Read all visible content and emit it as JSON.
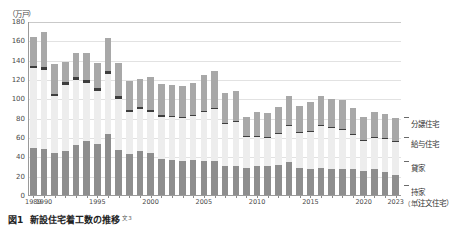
{
  "caption": {
    "number": "図1",
    "title": "新設住宅着工数の推移",
    "reference": "文3"
  },
  "chart_data": {
    "type": "bar",
    "stacked": true,
    "title": "新設住宅着工数の推移",
    "xlabel": "年",
    "ylabel": "万戸",
    "y_unit_label": "（万戸）",
    "x_unit_label": "（年）",
    "ylim": [
      0,
      180
    ],
    "ytick_step": 20,
    "yticks": [
      0,
      20,
      40,
      60,
      80,
      100,
      120,
      140,
      160,
      180
    ],
    "grid": true,
    "legend_position": "right",
    "categories": [
      "1989",
      "1990",
      "1991",
      "1992",
      "1993",
      "1994",
      "1995",
      "1996",
      "1997",
      "1998",
      "1999",
      "2000",
      "2001",
      "2002",
      "2003",
      "2004",
      "2005",
      "2006",
      "2007",
      "2008",
      "2009",
      "2010",
      "2011",
      "2012",
      "2013",
      "2014",
      "2015",
      "2016",
      "2017",
      "2018",
      "2019",
      "2020",
      "2021",
      "2022",
      "2023"
    ],
    "xtick_labels": [
      "1989",
      "1990",
      "1995",
      "2000",
      "2005",
      "2010",
      "2015",
      "2020",
      "2023"
    ],
    "series": [
      {
        "name": "持家（注文住宅）",
        "key": "owner",
        "color": "#8e8e8e",
        "values": [
          50,
          49,
          44,
          47,
          53,
          57,
          54,
          64,
          48,
          43,
          47,
          45,
          38,
          37,
          36,
          37,
          36,
          36,
          31,
          31,
          29,
          31,
          31,
          32,
          35,
          29,
          28,
          29,
          28,
          28,
          28,
          26,
          28,
          25,
          22
        ]
      },
      {
        "name": "貸家",
        "key": "rental",
        "color": "#ededed",
        "values": [
          82,
          81,
          59,
          68,
          67,
          60,
          55,
          62,
          52,
          44,
          43,
          42,
          44,
          45,
          45,
          46,
          51,
          54,
          44,
          46,
          32,
          30,
          29,
          32,
          37,
          36,
          38,
          43,
          42,
          40,
          35,
          31,
          32,
          34,
          34
        ]
      },
      {
        "name": "給与住宅",
        "key": "company",
        "color": "#3d3d3d",
        "values": [
          3,
          3,
          3,
          3,
          3,
          3,
          3,
          3,
          3,
          2,
          2,
          2,
          2,
          1,
          1,
          1,
          1,
          1,
          1,
          1,
          1,
          1,
          1,
          1,
          1,
          1,
          1,
          1,
          1,
          1,
          1,
          1,
          1,
          1,
          1
        ]
      },
      {
        "name": "分譲住宅",
        "key": "condo",
        "color": "#a8a8a8",
        "values": [
          30,
          37,
          31,
          21,
          25,
          28,
          26,
          34,
          35,
          30,
          29,
          34,
          32,
          32,
          32,
          33,
          37,
          38,
          31,
          31,
          20,
          25,
          25,
          27,
          30,
          27,
          30,
          30,
          29,
          30,
          27,
          24,
          26,
          25,
          24
        ]
      }
    ]
  },
  "legend": {
    "items": [
      {
        "label": "分譲住宅",
        "sub": ""
      },
      {
        "label": "給与住宅",
        "sub": ""
      },
      {
        "label": "貸家",
        "sub": ""
      },
      {
        "label": "持家",
        "sub": "（注文住宅）"
      }
    ]
  }
}
